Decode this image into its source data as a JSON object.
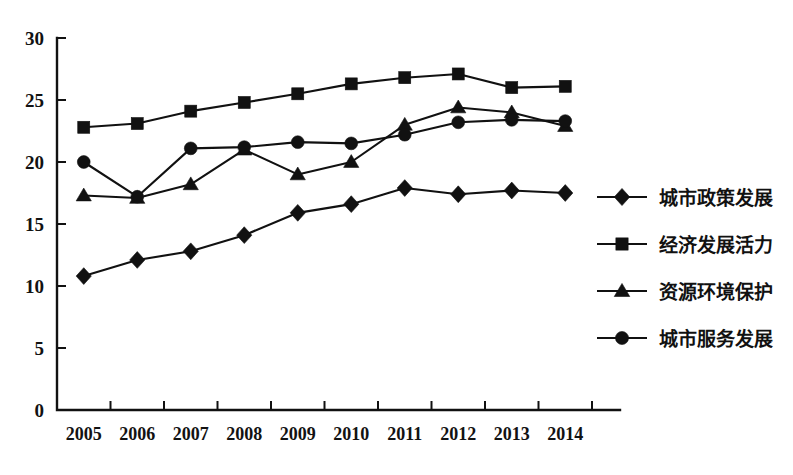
{
  "chart_data": {
    "type": "line",
    "title": "",
    "subtitle": "",
    "xlabel": "",
    "ylabel": "",
    "categories": [
      "2005",
      "2006",
      "2007",
      "2008",
      "2009",
      "2010",
      "2011",
      "2012",
      "2013",
      "2014"
    ],
    "x": [
      2005,
      2006,
      2007,
      2008,
      2009,
      2010,
      2011,
      2012,
      2013,
      2014
    ],
    "xlim": [
      2004.5,
      2014.5
    ],
    "ylim": [
      0,
      30
    ],
    "y_ticks": [
      0,
      5,
      10,
      15,
      20,
      25,
      30
    ],
    "x_ticks": [
      "2005",
      "2006",
      "2007",
      "2008",
      "2009",
      "2010",
      "2011",
      "2012",
      "2013",
      "2014"
    ],
    "grid": false,
    "legend_position": "right",
    "series": [
      {
        "name": "城市政策发展",
        "marker": "diamond",
        "color": "#111111",
        "values": [
          10.8,
          12.1,
          12.8,
          14.1,
          15.9,
          16.6,
          17.9,
          17.4,
          17.7,
          17.5
        ]
      },
      {
        "name": "经济发展活力",
        "marker": "square",
        "color": "#111111",
        "values": [
          22.8,
          23.1,
          24.1,
          24.8,
          25.5,
          26.3,
          26.8,
          27.1,
          26.0,
          26.1
        ]
      },
      {
        "name": "资源环境保护",
        "marker": "triangle",
        "color": "#111111",
        "values": [
          17.3,
          17.1,
          18.2,
          21.0,
          19.0,
          20.0,
          23.0,
          24.4,
          24.0,
          22.9
        ]
      },
      {
        "name": "城市服务发展",
        "marker": "circle",
        "color": "#111111",
        "values": [
          20.0,
          17.2,
          21.1,
          21.2,
          21.6,
          21.5,
          22.2,
          23.2,
          23.4,
          23.3
        ]
      }
    ]
  },
  "legend": {
    "items": [
      {
        "label": "城市政策发展",
        "marker": "diamond"
      },
      {
        "label": "经济发展活力",
        "marker": "square"
      },
      {
        "label": "资源环境保护",
        "marker": "triangle"
      },
      {
        "label": "城市服务发展",
        "marker": "circle"
      }
    ]
  }
}
